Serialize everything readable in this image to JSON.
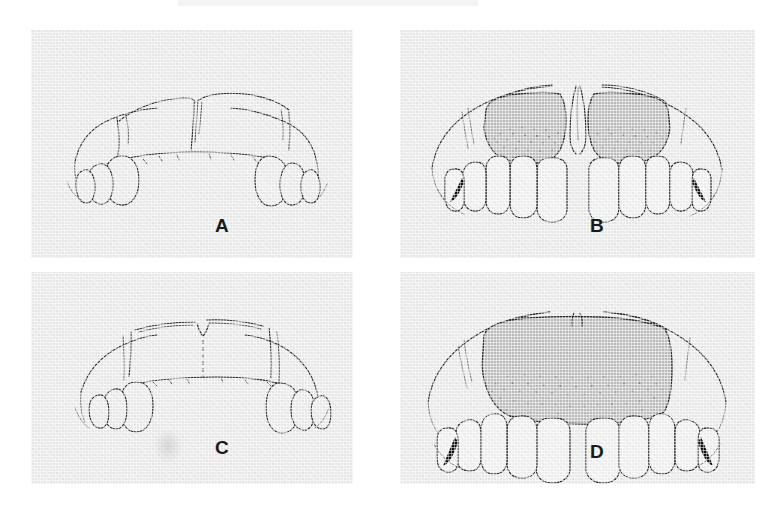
{
  "figure": {
    "kind": "four-panel line-drawing plate",
    "background_color": "#ffffff",
    "panel_background_color": "#e9e9e9",
    "ink_color": "#2b2b2b",
    "gingiva_shade_color": "#bdbdbd",
    "panels": [
      {
        "id": "A",
        "label": "A",
        "description": "Line drawing of maxillary arch, frontal view, anterior teeth absent / edentulous anterior ridge with posterior teeth only",
        "shaded_gingiva": false,
        "black_wedges": 0,
        "anterior_teeth_shown": 0,
        "posterior_teeth_shown": 6
      },
      {
        "id": "B",
        "label": "B",
        "description": "Line drawing of maxillary arch with full anterior teeth and shaded, stippled attached gingiva with high midline frenum notch",
        "shaded_gingiva": true,
        "black_wedges": 2,
        "anterior_teeth_shown": 6,
        "posterior_teeth_shown": 6
      },
      {
        "id": "C",
        "label": "C",
        "description": "Line drawing of maxillary arch, frontal view, flat square anterior ridge with dotted midline, posterior teeth only",
        "shaded_gingiva": false,
        "black_wedges": 0,
        "anterior_teeth_shown": 0,
        "posterior_teeth_shown": 6
      },
      {
        "id": "D",
        "label": "D",
        "description": "Line drawing of maxillary arch with full anterior teeth and broad shaded, stippled attached gingiva, shallow midline notch",
        "shaded_gingiva": true,
        "black_wedges": 2,
        "anterior_teeth_shown": 6,
        "posterior_teeth_shown": 6
      }
    ]
  }
}
